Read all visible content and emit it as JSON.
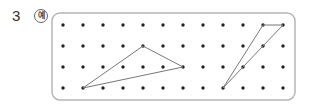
{
  "question": {
    "number": "3",
    "example_badge": "예"
  },
  "grid": {
    "cols": 12,
    "rows": 4,
    "origin_x": 63,
    "origin_y": 25,
    "spacing_x": 20,
    "spacing_y": 21,
    "frame": {
      "x": 52,
      "y": 13,
      "width": 243,
      "height": 87,
      "radius": 8,
      "stroke": "#b5b5b5"
    },
    "dot_color": "#222222"
  },
  "shapes": [
    {
      "name": "triangle-left",
      "points": [
        [
          1,
          3
        ],
        [
          4,
          1
        ],
        [
          6,
          2
        ]
      ],
      "stroke": "#777777"
    },
    {
      "name": "triangle-right",
      "points": [
        [
          8,
          3
        ],
        [
          10,
          0
        ],
        [
          11,
          0
        ]
      ],
      "stroke": "#777777"
    }
  ]
}
